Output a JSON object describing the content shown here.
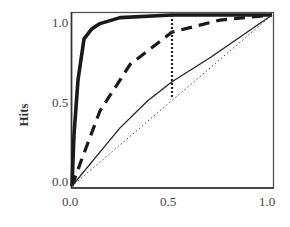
{
  "chart_data": {
    "type": "line",
    "title": "",
    "xlabel": "",
    "ylabel": "Hits",
    "xlim": [
      0,
      1
    ],
    "ylim": [
      0,
      1
    ],
    "grid": false,
    "legend": "none",
    "xticks": [
      "0.0",
      "0.5",
      "1.0"
    ],
    "yticks": [
      "0.0",
      "0.5",
      "1.0"
    ],
    "series": [
      {
        "name": "strong (thick solid)",
        "style": "thick-solid",
        "x": [
          0.0,
          0.01,
          0.03,
          0.06,
          0.1,
          0.14,
          0.24,
          0.5,
          1.0
        ],
        "y": [
          0.0,
          0.3,
          0.62,
          0.86,
          0.92,
          0.95,
          0.985,
          1.0,
          1.0
        ]
      },
      {
        "name": "moderate (dashed)",
        "style": "dashed",
        "x": [
          0.0,
          0.05,
          0.14,
          0.29,
          0.5,
          0.74,
          1.0
        ],
        "y": [
          0.0,
          0.16,
          0.44,
          0.71,
          0.9,
          0.97,
          1.0
        ]
      },
      {
        "name": "weak (thin solid)",
        "style": "thin-solid",
        "x": [
          0.0,
          0.12,
          0.24,
          0.38,
          0.5,
          0.69,
          1.0
        ],
        "y": [
          0.0,
          0.17,
          0.34,
          0.5,
          0.61,
          0.75,
          1.0
        ]
      },
      {
        "name": "chance (dotted diagonal)",
        "style": "dotted",
        "x": [
          0.0,
          1.0
        ],
        "y": [
          0.0,
          1.0
        ]
      }
    ],
    "annotations": [
      {
        "type": "vline",
        "style": "dotted-thick",
        "x": 0.5,
        "y_from": 0.52,
        "y_to": 1.0
      }
    ]
  },
  "axes": {
    "ylabel": "Hits",
    "x_tick_labels": [
      "0.0",
      "0.5",
      "1.0"
    ],
    "y_tick_labels": [
      "0.0",
      "0.5",
      "1.0"
    ]
  }
}
